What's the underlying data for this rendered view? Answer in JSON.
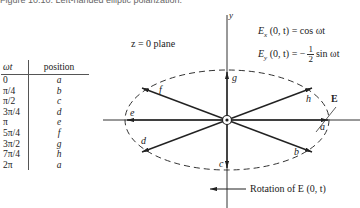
{
  "caption": "Figure 10.10.  Left-handed elliptic polarization.",
  "table": {
    "headers": [
      "ωt",
      "position"
    ],
    "rows": [
      [
        "0",
        "a"
      ],
      [
        "π/4",
        "b"
      ],
      [
        "π/2",
        "c"
      ],
      [
        "3π/4",
        "d"
      ],
      [
        "π",
        "e"
      ],
      [
        "5π/4",
        "f"
      ],
      [
        "3π/2",
        "g"
      ],
      [
        "7π/4",
        "h"
      ],
      [
        "2π",
        "a"
      ]
    ]
  },
  "diagram": {
    "plane_label": "z = 0 plane",
    "y_axis_label": "y",
    "vector_label": "E",
    "rotation_label": "Rotation of E (0, t)",
    "equation_x": {
      "lhs": "E",
      "sub": "x",
      "args": " (0, t) = cos ωt"
    },
    "equation_y": {
      "lhs": "E",
      "sub": "y",
      "args": " (0, t) = −",
      "num": "1",
      "den": "2",
      "tail": "sin ωt"
    },
    "points": [
      {
        "label": "a",
        "angle_deg": 0
      },
      {
        "label": "b",
        "angle_deg": -45
      },
      {
        "label": "c",
        "angle_deg": -90
      },
      {
        "label": "d",
        "angle_deg": -135
      },
      {
        "label": "e",
        "angle_deg": 180
      },
      {
        "label": "f",
        "angle_deg": 135
      },
      {
        "label": "g",
        "angle_deg": 90
      },
      {
        "label": "h",
        "angle_deg": 45
      }
    ]
  }
}
